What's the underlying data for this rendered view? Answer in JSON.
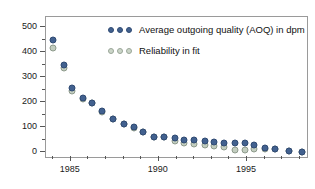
{
  "chart_data": {
    "type": "scatter",
    "title": "",
    "xlabel": "",
    "ylabel": "",
    "xlim": [
      1983.6,
      1998.4
    ],
    "ylim": [
      -20,
      540
    ],
    "grid": false,
    "legend_position": "top-center",
    "x_ticks": [
      1985,
      1990,
      1995
    ],
    "x_tick_labels": [
      "1985",
      "1990",
      "1995"
    ],
    "x_minor_ticks": [
      1984,
      1986,
      1987,
      1988,
      1989,
      1991,
      1992,
      1993,
      1994,
      1996,
      1997,
      1998
    ],
    "y_ticks": [
      0,
      100,
      200,
      300,
      400,
      500
    ],
    "y_tick_labels": [
      "0",
      "100",
      "200",
      "300",
      "400",
      "500"
    ],
    "y_minor_ticks": [
      50,
      150,
      250,
      350,
      450
    ],
    "series": [
      {
        "name": "Average outgoing quality (AOQ) in dpm",
        "color": "#42618f",
        "marker": "filled-circle",
        "x": [
          1984.0,
          1984.6,
          1985.1,
          1985.7,
          1986.2,
          1986.8,
          1987.4,
          1988.0,
          1988.6,
          1989.1,
          1989.7,
          1990.3,
          1990.9,
          1991.4,
          1992.0,
          1992.6,
          1993.1,
          1993.7,
          1994.3,
          1994.9,
          1995.4,
          1996.0,
          1996.6,
          1997.4,
          1998.1
        ],
        "values": [
          450,
          348,
          256,
          218,
          196,
          164,
          134,
          113,
          101,
          82,
          61,
          61,
          55,
          50,
          48,
          44,
          40,
          36,
          35,
          36,
          27,
          18,
          12,
          5,
          2
        ]
      },
      {
        "name": "Reliability in fit",
        "color": "#c2cdbf",
        "marker": "open-circle",
        "x": [
          1984.0,
          1984.6,
          1985.1,
          1985.7,
          1986.2,
          1986.8,
          1987.4,
          1988.0,
          1988.6,
          1989.1,
          1989.7,
          1990.3,
          1990.9,
          1991.4,
          1992.0,
          1992.6,
          1993.1,
          1993.7,
          1994.3,
          1994.9,
          1995.4,
          1996.0,
          1996.6,
          1997.4,
          1998.1
        ],
        "values": [
          415,
          338,
          244,
          213,
          196,
          162,
          134,
          113,
          95,
          80,
          61,
          61,
          45,
          38,
          31,
          29,
          24,
          22,
          10,
          9,
          13,
          12,
          11,
          4,
          1
        ]
      }
    ]
  },
  "legend": {
    "entries": [
      {
        "label": "Average outgoing quality (AOQ) in dpm",
        "marker_count": 3
      },
      {
        "label": "Reliability in fit",
        "marker_count": 3
      }
    ]
  }
}
